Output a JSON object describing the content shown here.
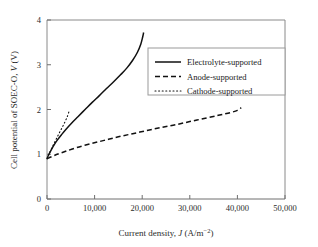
{
  "chart_data": {
    "type": "line",
    "title": "",
    "xlabel": "Current density, J (A/m−2)",
    "xlabel_parts": {
      "prefix": "Current density, ",
      "symbol": "J",
      "units_open": " (A/m",
      "units_exp": "−2",
      "units_close": ")"
    },
    "ylabel": "Cell potential of SOEC-O, V (V)",
    "ylabel_parts": {
      "prefix": "Cell potential of SOEC-O, ",
      "symbol": "V",
      "units": " (V)"
    },
    "xlim": [
      0,
      50000
    ],
    "ylim": [
      0,
      4
    ],
    "xticks": [
      0,
      10000,
      20000,
      30000,
      40000,
      50000
    ],
    "xtick_labels": [
      "0",
      "10,000",
      "20,000",
      "30,000",
      "40,000",
      "50,000"
    ],
    "yticks": [
      0,
      1,
      2,
      3,
      4
    ],
    "ytick_labels": [
      "0",
      "1",
      "2",
      "3",
      "4"
    ],
    "grid": false,
    "legend_position": "upper-right-inside",
    "series": [
      {
        "name": "Electrolyte-supported",
        "style": "solid",
        "color": "#111111",
        "points": [
          [
            0,
            0.9
          ],
          [
            400,
            1.0
          ],
          [
            900,
            1.1
          ],
          [
            1500,
            1.21
          ],
          [
            2200,
            1.32
          ],
          [
            3000,
            1.43
          ],
          [
            4000,
            1.56
          ],
          [
            5200,
            1.7
          ],
          [
            6500,
            1.84
          ],
          [
            8000,
            2.0
          ],
          [
            9500,
            2.16
          ],
          [
            11000,
            2.31
          ],
          [
            12500,
            2.47
          ],
          [
            14000,
            2.62
          ],
          [
            15500,
            2.78
          ],
          [
            16800,
            2.93
          ],
          [
            18000,
            3.1
          ],
          [
            19000,
            3.28
          ],
          [
            19700,
            3.46
          ],
          [
            20100,
            3.62
          ],
          [
            20300,
            3.72
          ]
        ]
      },
      {
        "name": "Anode-supported",
        "style": "dashed",
        "color": "#111111",
        "points": [
          [
            0,
            0.9
          ],
          [
            1500,
            0.97
          ],
          [
            3500,
            1.05
          ],
          [
            6000,
            1.14
          ],
          [
            9000,
            1.23
          ],
          [
            12000,
            1.31
          ],
          [
            15000,
            1.39
          ],
          [
            18000,
            1.46
          ],
          [
            21000,
            1.53
          ],
          [
            24000,
            1.6
          ],
          [
            27000,
            1.66
          ],
          [
            30000,
            1.73
          ],
          [
            33000,
            1.8
          ],
          [
            36000,
            1.87
          ],
          [
            38500,
            1.93
          ],
          [
            40000,
            1.98
          ],
          [
            40800,
            2.04
          ]
        ]
      },
      {
        "name": "Cathode-supported",
        "style": "dotted",
        "color": "#111111",
        "points": [
          [
            0,
            0.9
          ],
          [
            500,
            1.02
          ],
          [
            1100,
            1.16
          ],
          [
            1800,
            1.31
          ],
          [
            2500,
            1.46
          ],
          [
            3200,
            1.6
          ],
          [
            3800,
            1.73
          ],
          [
            4300,
            1.85
          ],
          [
            4600,
            1.95
          ]
        ]
      }
    ]
  },
  "legend": {
    "items": [
      {
        "label": "Electrolyte-supported",
        "style": "solid"
      },
      {
        "label": "Anode-supported",
        "style": "dashed"
      },
      {
        "label": "Cathode-supported",
        "style": "dotted"
      }
    ]
  }
}
